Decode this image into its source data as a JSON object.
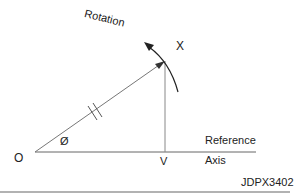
{
  "diagram": {
    "labels": {
      "origin": "O",
      "tip": "X",
      "projection": "V",
      "angle": "Ø",
      "rotation": "Rotation",
      "reference_line1": "Reference",
      "reference_line2": "Axis",
      "figure_id": "JDPX3402"
    },
    "geometry": {
      "origin": [
        35,
        152
      ],
      "tip": [
        165,
        61
      ],
      "foot": [
        165,
        152
      ],
      "axis_end": [
        255,
        152
      ],
      "hash_marks": 2,
      "rotation_arc": "clockwise-to-counterclockwise arrow around tip"
    },
    "colors": {
      "line": "#555555",
      "text": "#222222",
      "rule": "#999999"
    }
  }
}
